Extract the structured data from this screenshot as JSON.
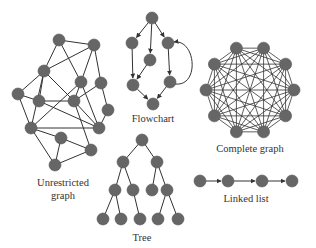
{
  "style": {
    "node_fill": "#666666",
    "node_stroke": "#555555",
    "edge_color": "#333333",
    "node_radius": 6
  },
  "diagrams": {
    "unrestricted": {
      "label_line1": "Unrestricted",
      "label_line2": "graph",
      "nodes": [
        [
          59,
          40
        ],
        [
          94,
          45
        ],
        [
          44,
          71
        ],
        [
          81,
          82
        ],
        [
          101,
          83
        ],
        [
          18,
          94
        ],
        [
          39,
          101
        ],
        [
          74,
          101
        ],
        [
          108,
          110
        ],
        [
          31,
          128
        ],
        [
          99,
          128
        ],
        [
          61,
          138
        ],
        [
          91,
          150
        ],
        [
          55,
          165
        ]
      ],
      "edges": [
        [
          0,
          1
        ],
        [
          0,
          2
        ],
        [
          0,
          3
        ],
        [
          1,
          2
        ],
        [
          1,
          3
        ],
        [
          1,
          4
        ],
        [
          2,
          5
        ],
        [
          2,
          6
        ],
        [
          2,
          7
        ],
        [
          2,
          9
        ],
        [
          3,
          10
        ],
        [
          3,
          9
        ],
        [
          4,
          7
        ],
        [
          4,
          8
        ],
        [
          5,
          6
        ],
        [
          5,
          9
        ],
        [
          6,
          10
        ],
        [
          6,
          7
        ],
        [
          7,
          10
        ],
        [
          7,
          12
        ],
        [
          8,
          10
        ],
        [
          9,
          11
        ],
        [
          9,
          13
        ],
        [
          11,
          12
        ],
        [
          9,
          10
        ],
        [
          12,
          13
        ],
        [
          11,
          13
        ],
        [
          3,
          7
        ]
      ]
    },
    "flowchart": {
      "label": "Flowchart",
      "nodes": [
        [
          152,
          18
        ],
        [
          132,
          43
        ],
        [
          150,
          60
        ],
        [
          168,
          43
        ],
        [
          133,
          85
        ],
        [
          170,
          82
        ],
        [
          153,
          104
        ]
      ],
      "edges": [
        [
          0,
          1
        ],
        [
          0,
          2
        ],
        [
          0,
          3
        ],
        [
          1,
          4
        ],
        [
          2,
          4
        ],
        [
          3,
          5
        ],
        [
          4,
          6
        ],
        [
          5,
          6
        ]
      ],
      "curved_edge": [
        5,
        3
      ]
    },
    "complete": {
      "label": "Complete graph",
      "center": [
        250,
        90
      ],
      "radius": 44,
      "count": 10
    },
    "tree": {
      "label": "Tree",
      "nodes": [
        [
          142,
          140
        ],
        [
          123,
          162
        ],
        [
          157,
          162
        ],
        [
          115,
          190
        ],
        [
          133,
          190
        ],
        [
          152,
          190
        ],
        [
          167,
          190
        ],
        [
          103,
          219
        ],
        [
          121,
          219
        ],
        [
          140,
          219
        ],
        [
          158,
          219
        ],
        [
          178,
          219
        ]
      ],
      "edges": [
        [
          0,
          1
        ],
        [
          0,
          2
        ],
        [
          1,
          3
        ],
        [
          1,
          4
        ],
        [
          2,
          5
        ],
        [
          2,
          6
        ],
        [
          3,
          7
        ],
        [
          3,
          8
        ],
        [
          4,
          9
        ],
        [
          6,
          10
        ],
        [
          6,
          11
        ]
      ]
    },
    "linked_list": {
      "label": "Linked list",
      "nodes": [
        [
          200,
          181
        ],
        [
          228,
          181
        ],
        [
          262,
          181
        ],
        [
          292,
          181
        ]
      ]
    }
  }
}
